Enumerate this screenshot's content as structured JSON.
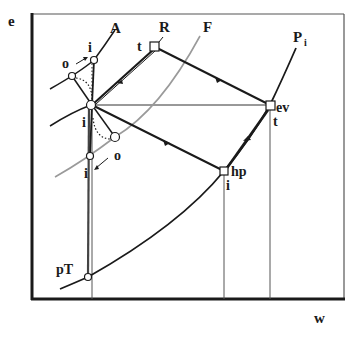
{
  "axes": {
    "y_label": "e",
    "x_label": "w"
  },
  "curves": {
    "A": "A",
    "R": "R",
    "F": "F",
    "Pi_main": "P",
    "Pi_sub": "i"
  },
  "points": {
    "R_state": "t",
    "ev_name": "ev",
    "ev_state": "t",
    "hp_name": "hp",
    "hp_state": "i",
    "pT_name": "pT",
    "upper_o": "o",
    "upper_i": "i",
    "center_i": "i",
    "lower_o": "o",
    "lower_i": "i"
  },
  "colors": {
    "ink": "#1a1a1a",
    "gray_curve": "#9a9a9a",
    "frame": "#222222"
  }
}
